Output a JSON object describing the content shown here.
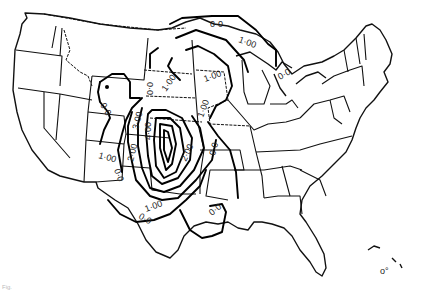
{
  "map": {
    "type": "contour-map",
    "region": "Contiguous United States",
    "contour_labels": [
      {
        "id": "nw-0",
        "text": "0·0",
        "x": 100,
        "y": 105,
        "rot": 60
      },
      {
        "id": "co-0",
        "text": "0·0",
        "x": 147,
        "y": 82,
        "rot": 90
      },
      {
        "id": "ne-1",
        "text": "1·00",
        "x": 166,
        "y": 92,
        "rot": -55
      },
      {
        "id": "gl-0",
        "text": "0·0",
        "x": 215,
        "y": 27,
        "rot": 0
      },
      {
        "id": "gl-1",
        "text": "1·00",
        "x": 243,
        "y": 44,
        "rot": 20
      },
      {
        "id": "mw-1",
        "text": "1·00",
        "x": 213,
        "y": 79,
        "rot": -20
      },
      {
        "id": "mi-0",
        "text": "0·0",
        "x": 283,
        "y": 77,
        "rot": -30
      },
      {
        "id": "mo-1",
        "text": "1·00",
        "x": 205,
        "y": 113,
        "rot": -70
      },
      {
        "id": "ks-3",
        "text": "3·00",
        "x": 137,
        "y": 124,
        "rot": -75
      },
      {
        "id": "ks-4",
        "text": "4·00",
        "x": 148,
        "y": 136,
        "rot": -90
      },
      {
        "id": "ok-2a",
        "text": "2·00",
        "x": 132,
        "y": 162,
        "rot": -75
      },
      {
        "id": "ok-2b",
        "text": "2·00",
        "x": 184,
        "y": 155,
        "rot": -65
      },
      {
        "id": "ar-0",
        "text": "0·0",
        "x": 213,
        "y": 150,
        "rot": -75
      },
      {
        "id": "nm-1",
        "text": "1·00",
        "x": 110,
        "y": 157,
        "rot": 15
      },
      {
        "id": "nm-0",
        "text": "0·0",
        "x": 119,
        "y": 175,
        "rot": 70
      },
      {
        "id": "tx-1",
        "text": "1·00",
        "x": 157,
        "y": 212,
        "rot": -20
      },
      {
        "id": "tx-0",
        "text": "0·0",
        "x": 141,
        "y": 222,
        "rot": 30
      },
      {
        "id": "la-0",
        "text": "0·0",
        "x": 216,
        "y": 212,
        "rot": -40
      }
    ],
    "contour_levels": [
      "0·0",
      "1·00",
      "2·00",
      "3·00",
      "4·00"
    ],
    "line_color": "#000000",
    "background": "#ffffff"
  },
  "caption": "Fig."
}
